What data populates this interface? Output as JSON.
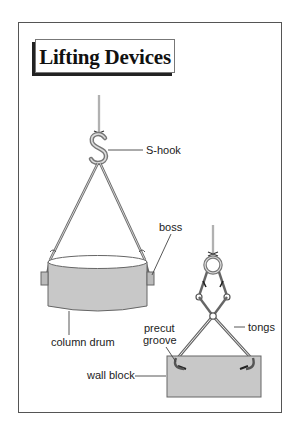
{
  "title": "Lifting Devices",
  "labels": {
    "s_hook": "S-hook",
    "boss": "boss",
    "column_drum": "column drum",
    "precut_line1": "precut",
    "precut_line2": "groove",
    "tongs": "tongs",
    "wall_block": "wall block"
  },
  "colors": {
    "frame": "#555555",
    "stone_fill": "#c8c8c8",
    "stone_stroke": "#666666",
    "metal": "#888888",
    "text": "#222222"
  }
}
